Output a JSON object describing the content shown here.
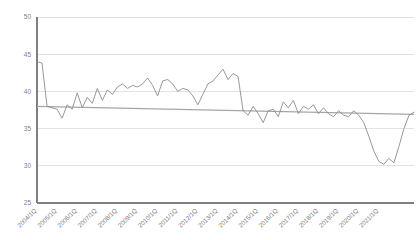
{
  "chart_data": {
    "type": "line",
    "title": "",
    "subtitle": "",
    "xlabel": "",
    "ylabel": "",
    "ylim": [
      25,
      50
    ],
    "yticks": [
      25,
      30,
      35,
      40,
      45,
      50
    ],
    "grid": true,
    "legend_position": "none",
    "line_color": "#8c8c8c",
    "trend_color": "#a6a6a6",
    "grid_color": "#e3e3e3",
    "axis_color": "#7f7f7f",
    "background": "#ffffff",
    "x_tick_labels": [
      "2004/1Q",
      "2005/1Q",
      "2006/1Q",
      "2007/1Q",
      "2008/1Q",
      "2009/1Q",
      "2010/1Q",
      "2011/1Q",
      "2012/1Q",
      "2013/1Q",
      "2014/1Q",
      "2015/1Q",
      "2016/1Q",
      "2017/1Q",
      "2018/1Q",
      "2019/1Q",
      "2020/1Q",
      "2021/1Q"
    ],
    "x_tick_indices": [
      0,
      4,
      8,
      12,
      16,
      20,
      24,
      28,
      32,
      36,
      40,
      44,
      48,
      52,
      56,
      60,
      64,
      68
    ],
    "series": [
      {
        "name": "value",
        "values": [
          44.0,
          43.8,
          38.0,
          37.8,
          37.6,
          36.4,
          38.2,
          37.6,
          39.8,
          37.8,
          39.2,
          38.4,
          40.4,
          38.8,
          40.2,
          39.6,
          40.6,
          41.0,
          40.4,
          40.8,
          40.6,
          41.0,
          41.8,
          40.8,
          39.4,
          41.4,
          41.6,
          41.0,
          40.0,
          40.4,
          40.2,
          39.4,
          38.2,
          39.6,
          41.0,
          41.4,
          42.2,
          43.0,
          41.6,
          42.4,
          42.0,
          37.4,
          36.8,
          38.0,
          37.0,
          35.8,
          37.4,
          37.6,
          36.6,
          38.6,
          37.8,
          38.8,
          37.0,
          38.0,
          37.6,
          38.2,
          37.0,
          37.8,
          37.0,
          36.6,
          37.4,
          36.8,
          36.6,
          37.4,
          36.8,
          35.8,
          34.0,
          32.0,
          30.6,
          30.2,
          31.0,
          30.4,
          32.6,
          35.0,
          36.8,
          37.2
        ]
      }
    ],
    "trend_line": {
      "name": "reference-line",
      "start_value": 38.0,
      "end_value": 36.9
    }
  }
}
